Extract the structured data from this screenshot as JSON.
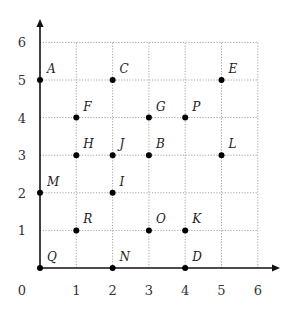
{
  "chart_data": {
    "type": "scatter",
    "title": "",
    "xlabel": "",
    "ylabel": "",
    "xlim": [
      0,
      6
    ],
    "ylim": [
      0,
      6
    ],
    "grid": true,
    "x_ticks": [
      "0",
      "1",
      "2",
      "3",
      "4",
      "5",
      "6"
    ],
    "y_ticks": [
      "1",
      "2",
      "3",
      "4",
      "5",
      "6"
    ],
    "points": [
      {
        "label": "A",
        "x": 0,
        "y": 5
      },
      {
        "label": "C",
        "x": 2,
        "y": 5
      },
      {
        "label": "E",
        "x": 5,
        "y": 5
      },
      {
        "label": "F",
        "x": 1,
        "y": 4
      },
      {
        "label": "G",
        "x": 3,
        "y": 4
      },
      {
        "label": "P",
        "x": 4,
        "y": 4
      },
      {
        "label": "H",
        "x": 1,
        "y": 3
      },
      {
        "label": "J",
        "x": 2,
        "y": 3
      },
      {
        "label": "B",
        "x": 3,
        "y": 3
      },
      {
        "label": "L",
        "x": 5,
        "y": 3
      },
      {
        "label": "M",
        "x": 0,
        "y": 2
      },
      {
        "label": "I",
        "x": 2,
        "y": 2
      },
      {
        "label": "R",
        "x": 1,
        "y": 1
      },
      {
        "label": "O",
        "x": 3,
        "y": 1
      },
      {
        "label": "K",
        "x": 4,
        "y": 1
      },
      {
        "label": "Q",
        "x": 0,
        "y": 0
      },
      {
        "label": "N",
        "x": 2,
        "y": 0
      },
      {
        "label": "D",
        "x": 4,
        "y": 0
      }
    ]
  },
  "colors": {
    "axis": "#111111",
    "grid": "#9a9a9a",
    "point": "#000000"
  }
}
